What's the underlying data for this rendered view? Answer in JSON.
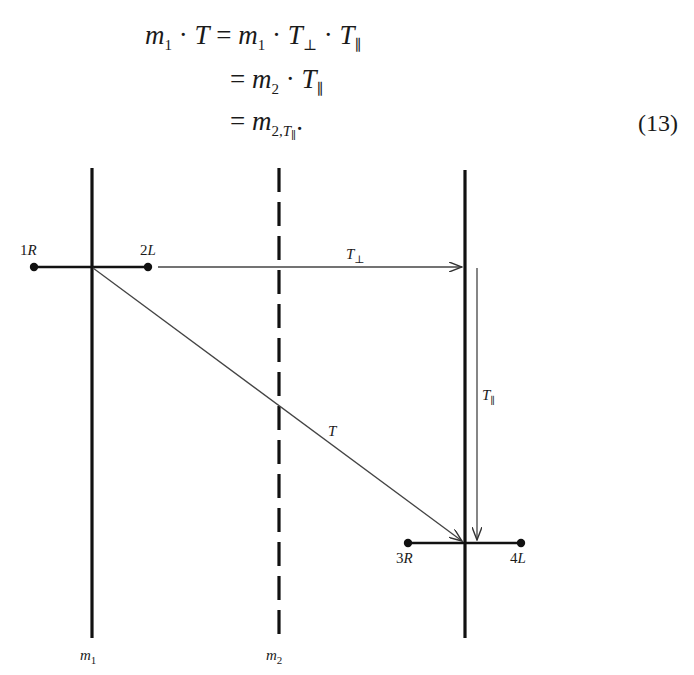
{
  "equation": {
    "lines": [
      {
        "lhs": "m₁ · T",
        "rhs": "= m₁ · T⊥ · T∥"
      },
      {
        "lhs": "",
        "rhs": "= m₂ · T∥"
      },
      {
        "lhs": "",
        "rhs": "= m₂,T∥ ."
      }
    ],
    "number": "(13)"
  },
  "diagram": {
    "mirrors": [
      {
        "id": "m1",
        "label": "m",
        "subscript": "1",
        "style": "solid"
      },
      {
        "id": "m2",
        "label": "m",
        "subscript": "2",
        "style": "dashed"
      },
      {
        "id": "m3",
        "label": "",
        "subscript": "",
        "style": "solid"
      }
    ],
    "points": {
      "p1": {
        "label": "1R"
      },
      "p2": {
        "label": "2L"
      },
      "p3": {
        "label": "3R"
      },
      "p4": {
        "label": "4L"
      }
    },
    "arrows": {
      "perp": {
        "label": "T",
        "subscript": "⊥"
      },
      "parallel": {
        "label": "T",
        "subscript": "∥"
      },
      "diagonal": {
        "label": "T"
      }
    }
  }
}
